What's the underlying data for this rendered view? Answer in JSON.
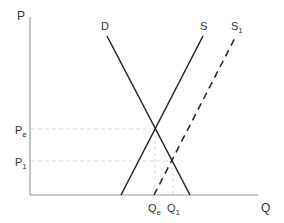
{
  "diagram": {
    "type": "supply-demand",
    "axes": {
      "y_label": "P",
      "x_label": "Q"
    },
    "curves": [
      {
        "id": "demand",
        "label": "D",
        "style": "solid"
      },
      {
        "id": "supply",
        "label": "S",
        "style": "solid"
      },
      {
        "id": "supply-shifted",
        "label": "S",
        "subscript": "1",
        "style": "dashed"
      }
    ],
    "price_levels": [
      {
        "id": "pe",
        "label": "P",
        "subscript": "e"
      },
      {
        "id": "p1",
        "label": "P",
        "subscript": "1"
      }
    ],
    "quantity_levels": [
      {
        "id": "qe",
        "label": "Q",
        "subscript": "e"
      },
      {
        "id": "q1",
        "label": "Q",
        "subscript": "1"
      }
    ],
    "colors": {
      "axis": "#999999",
      "curve": "#222222",
      "guide": "#cccccc",
      "text": "#333333"
    }
  }
}
